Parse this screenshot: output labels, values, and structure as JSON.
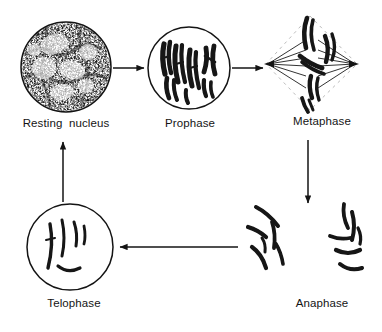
{
  "diagram": {
    "type": "cycle",
    "background_color": "#ffffff",
    "ink_color": "#111111",
    "stages": [
      {
        "id": "resting-nucleus",
        "label": "Resting  nucleus",
        "shape": "circle",
        "has_outline": true,
        "content": "stippled granular chromatin network",
        "center": [
          66,
          67
        ],
        "radius": 45
      },
      {
        "id": "prophase",
        "label": "Prophase",
        "shape": "circle",
        "has_outline": true,
        "content": "condensed thick dark chromosomes",
        "center": [
          189,
          68
        ],
        "radius": 41
      },
      {
        "id": "metaphase",
        "label": "Metaphase",
        "shape": "spindle",
        "has_outline": false,
        "content": "chromosomes aligned on equator with spindle fibres radiating to two poles",
        "center": [
          310,
          62
        ],
        "radius": 50
      },
      {
        "id": "anaphase",
        "label": "Anaphase",
        "shape": "none",
        "has_outline": false,
        "content": "two separated groups of chromosomes migrating to opposite poles",
        "center": [
          310,
          250
        ],
        "radius": 55
      },
      {
        "id": "telophase",
        "label": "Telophase",
        "shape": "circle",
        "has_outline": true,
        "content": "thin decondensing chromosomes inside reforming nucleus",
        "center": [
          70,
          247
        ],
        "radius": 43
      }
    ],
    "arrows": [
      {
        "id": "arrow-resting-to-prophase",
        "from": "resting-nucleus",
        "to": "prophase",
        "direction": "right"
      },
      {
        "id": "arrow-prophase-to-metaphase",
        "from": "prophase",
        "to": "metaphase",
        "direction": "right"
      },
      {
        "id": "arrow-metaphase-to-anaphase",
        "from": "metaphase",
        "to": "anaphase",
        "direction": "down"
      },
      {
        "id": "arrow-anaphase-to-telophase",
        "from": "anaphase",
        "to": "telophase",
        "direction": "left"
      },
      {
        "id": "arrow-telophase-to-resting",
        "from": "telophase",
        "to": "resting-nucleus",
        "direction": "up"
      }
    ]
  }
}
